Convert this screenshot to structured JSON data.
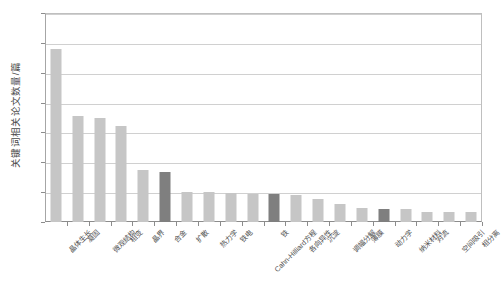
{
  "chart_data": {
    "type": "bar",
    "title": "",
    "xlabel": "",
    "ylabel": "关键词相关论文数量/篇",
    "ylim": [
      0,
      700
    ],
    "ytick_step": 100,
    "yticks": [
      "0",
      "100",
      "200",
      "300",
      "400",
      "500",
      "600",
      "700"
    ],
    "grid": true,
    "legend": "none",
    "bar_color_normal": "#c6c6c6",
    "bar_color_highlight": "#7f7f7f",
    "categories": [
      "晶体生长",
      "凝固",
      "微观结构",
      "相变",
      "晶界",
      "合金",
      "扩散",
      "热力学",
      "铁电",
      "Cahn-Hilliard方程",
      "铁",
      "各向异性",
      "沉淀",
      "调幅分解",
      "薄膜",
      "动力学",
      "纳米材料",
      "对流",
      "空间吸引",
      "相分离"
    ],
    "values": [
      580,
      355,
      348,
      320,
      175,
      168,
      100,
      100,
      98,
      95,
      93,
      90,
      78,
      62,
      48,
      45,
      45,
      35,
      33,
      32
    ],
    "highlighted": [
      5,
      10,
      15
    ],
    "series": [
      {
        "name": "关键词相关论文数量",
        "values": [
          580,
          355,
          348,
          320,
          175,
          168,
          100,
          100,
          98,
          95,
          93,
          90,
          78,
          62,
          48,
          45,
          45,
          35,
          33,
          32
        ]
      }
    ]
  }
}
